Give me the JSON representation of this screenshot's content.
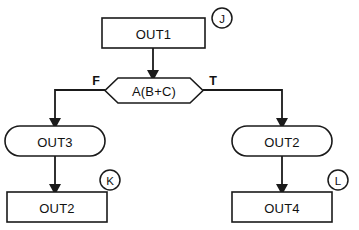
{
  "diagram": {
    "style": {
      "background": "#ffffff",
      "line_color": "#1a1a1a",
      "text_color": "#111111",
      "shape_fill": "#ffffff"
    },
    "nodes": [
      {
        "id": "out1",
        "label": "OUT1",
        "shape": "rectangle",
        "x": 102,
        "y": 18,
        "width": 103,
        "height": 30
      },
      {
        "id": "decision",
        "label": "A(B+C)",
        "shape": "hexagon",
        "x": 105,
        "y": 78,
        "width": 98,
        "height": 25
      },
      {
        "id": "out3",
        "label": "OUT3",
        "shape": "stadium",
        "x": 5,
        "y": 126,
        "width": 100,
        "height": 30
      },
      {
        "id": "out2_right",
        "label": "OUT2",
        "shape": "stadium",
        "x": 232,
        "y": 126,
        "width": 100,
        "height": 30
      },
      {
        "id": "out2_bottom",
        "label": "OUT2",
        "shape": "rectangle",
        "x": 7,
        "y": 192,
        "width": 100,
        "height": 30
      },
      {
        "id": "out4",
        "label": "OUT4",
        "shape": "rectangle",
        "x": 232,
        "y": 192,
        "width": 100,
        "height": 30
      }
    ],
    "branch_labels": [
      {
        "id": "false-branch",
        "label": "F",
        "x": 96,
        "y": 81
      },
      {
        "id": "true-branch",
        "label": "T",
        "x": 213,
        "y": 81
      }
    ],
    "markers": [
      {
        "id": "marker-j",
        "label": "J",
        "cx": 222,
        "cy": 18,
        "r": 10
      },
      {
        "id": "marker-k",
        "label": "K",
        "cx": 110,
        "cy": 180,
        "r": 10
      },
      {
        "id": "marker-l",
        "label": "L",
        "cx": 338,
        "cy": 180,
        "r": 10
      }
    ],
    "edges": [
      {
        "id": "out1-to-decision",
        "from": "out1",
        "to": "decision",
        "path": "M 153 48 L 153 72",
        "arrow": {
          "x": 153,
          "y": 79
        }
      },
      {
        "id": "decision-false-to-out3",
        "from": "decision",
        "to": "out3",
        "path": "M 105 90 L 55 90 L 55 120",
        "arrow": {
          "x": 55,
          "y": 127
        }
      },
      {
        "id": "decision-true-to-out2",
        "from": "decision",
        "to": "out2_right",
        "path": "M 203 90 L 282 90 L 282 120",
        "arrow": {
          "x": 282,
          "y": 127
        }
      },
      {
        "id": "out3-to-out2",
        "from": "out3",
        "to": "out2_bottom",
        "path": "M 55 156 L 55 186",
        "arrow": {
          "x": 55,
          "y": 193
        }
      },
      {
        "id": "out2-to-out4",
        "from": "out2_right",
        "to": "out4",
        "path": "M 282 156 L 282 186",
        "arrow": {
          "x": 282,
          "y": 193
        }
      }
    ]
  }
}
